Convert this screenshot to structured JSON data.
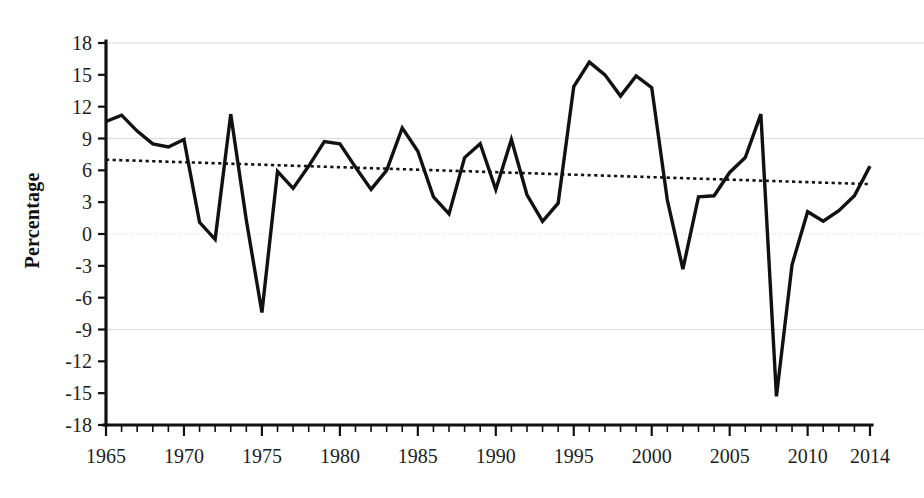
{
  "chart_data": {
    "type": "line",
    "title": "",
    "subtitle": "",
    "xlabel": "",
    "ylabel": "Percentage",
    "xlim": [
      1965,
      2014
    ],
    "ylim": [
      -18,
      18
    ],
    "grid": true,
    "legend": "none",
    "x_tick_labels": [
      "1965",
      "1970",
      "1975",
      "1980",
      "1985",
      "1990",
      "1995",
      "2000",
      "2005",
      "2010",
      "2014"
    ],
    "x_tick_values": [
      1965,
      1970,
      1975,
      1980,
      1985,
      1990,
      1995,
      2000,
      2005,
      2010,
      2014
    ],
    "x_minor_step": 1,
    "y_tick_labels": [
      "18",
      "15",
      "12",
      "9",
      "6",
      "3",
      "0",
      "-3",
      "-6",
      "-9",
      "-12",
      "-15",
      "-18"
    ],
    "y_tick_values": [
      18,
      15,
      12,
      9,
      6,
      3,
      0,
      -3,
      -6,
      -9,
      -12,
      -15,
      -18
    ],
    "series": [
      {
        "name": "percentage-series",
        "style": "solid",
        "color": "#111111",
        "x": [
          1965,
          1966,
          1967,
          1968,
          1969,
          1970,
          1971,
          1972,
          1973,
          1974,
          1975,
          1976,
          1977,
          1978,
          1979,
          1980,
          1981,
          1982,
          1983,
          1984,
          1985,
          1986,
          1987,
          1988,
          1989,
          1990,
          1991,
          1992,
          1993,
          1994,
          1995,
          1996,
          1997,
          1998,
          1999,
          2000,
          2001,
          2002,
          2003,
          2004,
          2005,
          2006,
          2007,
          2008,
          2009,
          2010,
          2011,
          2012,
          2013,
          2014
        ],
        "values": [
          10.6,
          11.2,
          9.7,
          8.5,
          8.2,
          8.9,
          1.1,
          -0.5,
          11.3,
          1.3,
          -7.4,
          5.9,
          4.3,
          6.4,
          8.7,
          8.5,
          6.3,
          4.2,
          6.0,
          10.0,
          7.8,
          3.5,
          1.9,
          7.2,
          8.5,
          4.2,
          8.9,
          3.7,
          1.2,
          2.9,
          13.9,
          16.2,
          15.0,
          13.0,
          14.9,
          13.8,
          3.2,
          -3.3,
          3.5,
          3.6,
          5.8,
          7.2,
          11.3,
          -15.3,
          -2.9,
          2.1,
          1.2,
          2.2,
          3.6,
          6.4
        ]
      },
      {
        "name": "trend-line",
        "style": "dotted",
        "color": "#111111",
        "x": [
          1965,
          2014
        ],
        "values": [
          7.0,
          4.7
        ]
      }
    ]
  },
  "axes": {
    "y_title": "Percentage"
  }
}
